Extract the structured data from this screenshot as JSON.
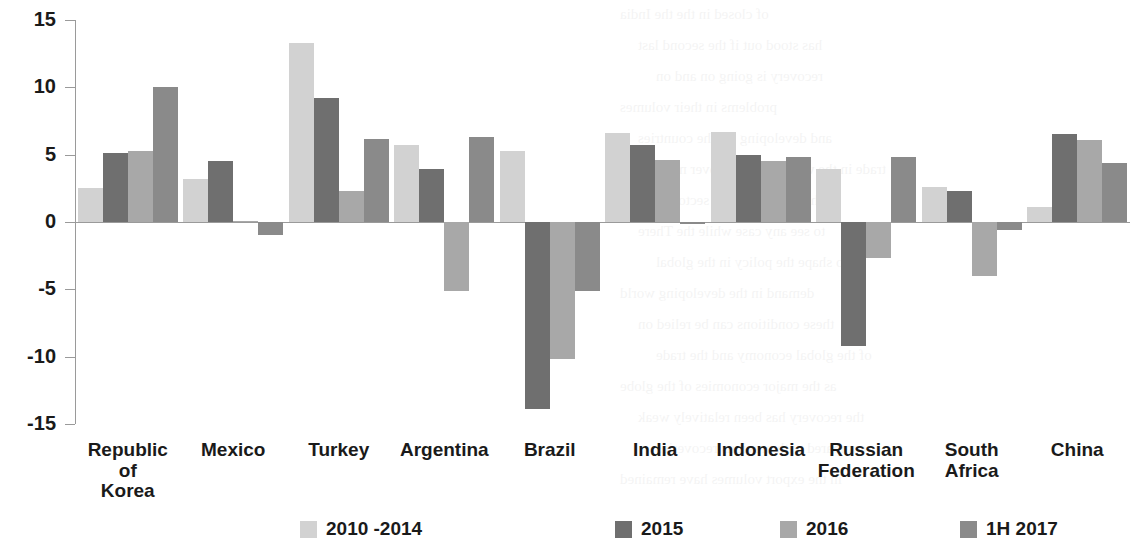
{
  "chart_data": {
    "type": "bar",
    "title": "",
    "subtitle": "",
    "xlabel": "",
    "ylabel": "",
    "ylim": [
      -15,
      15
    ],
    "yticks": [
      15,
      10,
      5,
      0,
      -5,
      -10,
      -15
    ],
    "ytick_labels": [
      "15",
      "10",
      "5",
      "0",
      "-5",
      "-10",
      "-15"
    ],
    "grid": false,
    "legend_position": "bottom",
    "categories": [
      "Republic\nof\nKorea",
      "Mexico",
      "Turkey",
      "Argentina",
      "Brazil",
      "India",
      "Indonesia",
      "Russian\nFederation",
      "South\nAfrica",
      "China"
    ],
    "series": [
      {
        "name": "2010 -2014",
        "color": "#d2d2d2",
        "values": [
          2.5,
          3.2,
          13.3,
          5.7,
          5.3,
          6.6,
          6.7,
          3.9,
          2.6,
          1.1
        ]
      },
      {
        "name": "2015",
        "color": "#6f6f6f",
        "values": [
          5.1,
          4.5,
          9.2,
          3.9,
          -13.9,
          5.7,
          5.0,
          -9.2,
          2.3,
          6.5
        ]
      },
      {
        "name": "2016",
        "color": "#a8a8a8",
        "values": [
          5.3,
          0.05,
          2.3,
          -5.1,
          -10.2,
          4.6,
          4.5,
          -2.7,
          -4.0,
          6.1
        ]
      },
      {
        "name": "1H 2017",
        "color": "#8a8a8a",
        "values": [
          10.0,
          -1.0,
          6.2,
          6.3,
          -5.1,
          -0.15,
          4.8,
          4.8,
          -0.6,
          4.4
        ]
      }
    ]
  },
  "legend": {
    "items": [
      {
        "label": "2010 -2014",
        "color": "#d2d2d2"
      },
      {
        "label": "2015",
        "color": "#6f6f6f"
      },
      {
        "label": "2016",
        "color": "#a8a8a8"
      },
      {
        "label": "1H 2017",
        "color": "#8a8a8a"
      }
    ]
  },
  "page_bleed": [
    "of closed  in the  the  India",
    "has stood  out  if  the  second  last",
    "recovery  is  going  on  and  on",
    "problems  in  their  volumes",
    "and  developing  for  the  countries",
    "trade  in  the  world  economy  over  more",
    "the  manufacturing  sector  has  man",
    "to  see  any  case  while  the  There",
    "to  shape  the  policy  in  the  global",
    "demand  in  the  developing  world",
    "these  conditions  can  be  relied  on",
    "of  the  global  economy  and  the  trade",
    "as  the  major  economies  of  the  globe",
    "the  recovery  has  been  relatively  weak",
    "compared  with  previous  recoveries",
    "in  the  export  volumes  have  remained"
  ]
}
